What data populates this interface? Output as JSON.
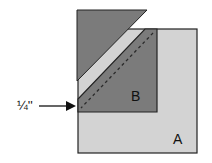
{
  "diagram": {
    "labels": {
      "seam_allowance": "¼''",
      "square_a": "A",
      "triangle_b": "B"
    },
    "colors": {
      "background": "#ffffff",
      "dark_piece": "#7b7b7b",
      "light_square": "#d3d3d3",
      "outline": "#222222",
      "seam_line": "#333333"
    }
  }
}
